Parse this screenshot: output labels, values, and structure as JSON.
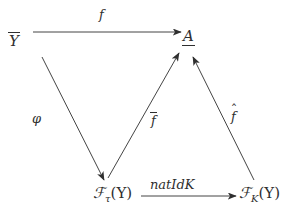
{
  "figure": {
    "kind": "commutative-diagram",
    "background_color": "#ffffff",
    "ink_color": "#2f2f2f",
    "width": 298,
    "height": 215
  },
  "nodes": [
    {
      "id": "ybar",
      "label": "Y",
      "accent": "overline",
      "text": "Y̅",
      "x": 9,
      "y": 32
    },
    {
      "id": "a",
      "label": "A",
      "accent": "underline",
      "text": "A̲",
      "x": 183,
      "y": 29
    },
    {
      "id": "ftauy",
      "label_main": "F",
      "label_sub": "τ",
      "label_arg": "(Y)",
      "text": "ℱτ(Y)",
      "x": 93,
      "y": 186
    },
    {
      "id": "fky",
      "label_main": "F",
      "label_sub": "K",
      "label_arg": "(Y)",
      "text": "ℱK(Y)",
      "x": 239,
      "y": 186
    }
  ],
  "edges": [
    {
      "id": "f",
      "from": "ybar",
      "to": "a",
      "label": "f",
      "accent": "none",
      "style": "straight-horizontal",
      "x1": 33,
      "y1": 32,
      "x2": 181,
      "y2": 32,
      "label_x": 99,
      "label_y": 8
    },
    {
      "id": "phi",
      "from": "ybar",
      "to": "ftauy",
      "label": "φ",
      "accent": "none",
      "style": "straight-diagonal",
      "x1": 42,
      "y1": 57,
      "x2": 104,
      "y2": 180,
      "label_x": 32,
      "label_y": 112
    },
    {
      "id": "fbar",
      "from": "ftauy",
      "to": "a",
      "label": "f",
      "accent": "overline",
      "text": "f̅",
      "style": "straight-diagonal",
      "x1": 108,
      "y1": 178,
      "x2": 179,
      "y2": 53,
      "label_x": 151,
      "label_y": 112
    },
    {
      "id": "fhat",
      "from": "fky",
      "to": "a",
      "label": "f",
      "accent": "hat",
      "text": "f̂",
      "style": "straight-diagonal",
      "x1": 254,
      "y1": 180,
      "x2": 193,
      "y2": 57,
      "label_x": 231,
      "label_y": 110
    },
    {
      "id": "natidk",
      "from": "ftauy",
      "to": "fky",
      "label": "natIdK",
      "accent": "none",
      "style": "straight-horizontal",
      "x1": 141,
      "y1": 196,
      "x2": 236,
      "y2": 196,
      "label_x": 150,
      "label_y": 178
    }
  ],
  "labels": {
    "f": "f",
    "phi": "φ",
    "fbar_base": "f",
    "fhat_base": "f",
    "hat_mark": "ˆ",
    "natidk": "natIdK",
    "ybar_base": "Y",
    "a_base": "A",
    "script_f": "ℱ",
    "sub_tau": "τ",
    "sub_k": "K",
    "paren_y": "(Y)"
  }
}
